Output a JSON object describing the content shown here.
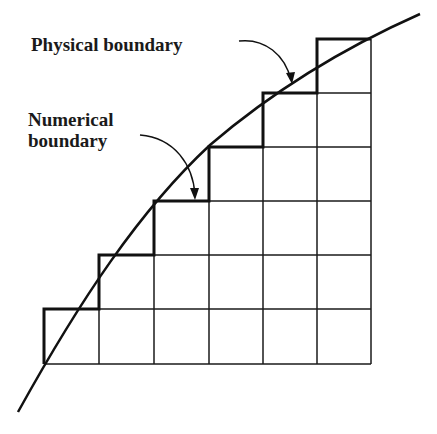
{
  "diagram": {
    "labels": {
      "physical": "Physical boundary",
      "numerical_line1": "Numerical",
      "numerical_line2": "boundary"
    },
    "grid": {
      "columns": 6,
      "rows": 6,
      "x_lines": [
        44,
        99,
        154,
        209,
        263,
        317,
        371
      ],
      "y_lines": [
        39,
        93,
        147,
        201,
        255,
        309,
        364
      ]
    },
    "colors": {
      "background": "#ffffff",
      "ink": "#111111"
    }
  }
}
